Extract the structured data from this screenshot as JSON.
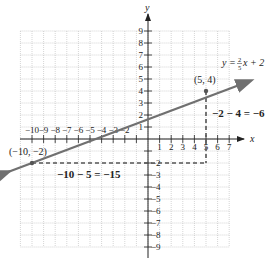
{
  "chart_data": {
    "type": "line",
    "title": "",
    "xlabel": "x",
    "ylabel": "y",
    "xlim": [
      -11,
      7
    ],
    "ylim": [
      -9,
      9
    ],
    "grid": true,
    "x_ticks": [
      -10,
      -9,
      -8,
      -7,
      -6,
      -5,
      -4,
      -3,
      -2,
      1,
      2,
      3,
      4,
      5,
      6,
      7
    ],
    "y_ticks": [
      9,
      8,
      7,
      6,
      5,
      4,
      3,
      2,
      1,
      -2,
      -3,
      -4,
      -5,
      -6,
      -7,
      -8,
      -9
    ],
    "series": [
      {
        "name": "y = 2/5 x + 2",
        "equation": "y = (2/5)x + 2",
        "slope": 0.4,
        "intercept": 2,
        "x": [
          -11,
          8.8
        ],
        "y": [
          -2.4,
          5.5
        ],
        "color": "#707070"
      }
    ],
    "points": [
      {
        "label": "(5, 4)",
        "x": 5,
        "y": 4
      },
      {
        "label": "(-10, -2)",
        "x": -10,
        "y": -2
      }
    ],
    "annotations": [
      {
        "text": "−2 − 4 = −6",
        "type": "vertical-dashed",
        "from": [
          5,
          4
        ],
        "to": [
          5,
          -2
        ]
      },
      {
        "text": "−10 − 5 = −15",
        "type": "horizontal-dashed",
        "from": [
          -10,
          -2
        ],
        "to": [
          5,
          -2
        ]
      }
    ]
  },
  "labels": {
    "x_axis": "x",
    "y_axis": "y",
    "line_eq_prefix": "y = ",
    "line_eq_num": "2",
    "line_eq_den": "5",
    "line_eq_suffix": "x + 2",
    "point_a": "(5, 4)",
    "point_b": "(−10, −2)",
    "rise_eq": "−2 − 4 = −6",
    "run_eq": "−10 − 5 = −15"
  }
}
